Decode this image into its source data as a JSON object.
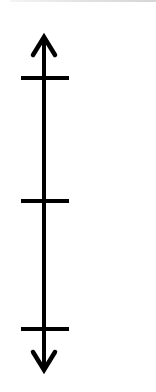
{
  "diagram": {
    "type": "vertical-number-line",
    "orientation": "vertical",
    "colors": {
      "line": "#000000",
      "background": "#ffffff",
      "top_edge": "#dcdcdc"
    },
    "axis": {
      "x": 44,
      "y_top": 35,
      "y_bottom": 372,
      "stroke_width": 4,
      "arrow_top": true,
      "arrow_bottom": true
    },
    "ticks": [
      {
        "y": 78,
        "x1": 21,
        "x2": 69,
        "label": ""
      },
      {
        "y": 201,
        "x1": 21,
        "x2": 69,
        "label": ""
      },
      {
        "y": 329,
        "x1": 21,
        "x2": 69,
        "label": ""
      }
    ]
  }
}
